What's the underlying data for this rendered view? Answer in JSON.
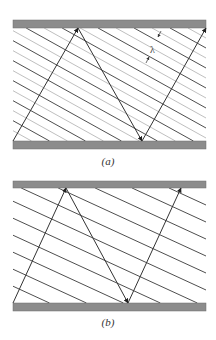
{
  "panels": [
    {
      "id": "a",
      "caption": "(a)",
      "label": "λ",
      "plate_color": "#8c8c8c",
      "ray_color": "#333333",
      "wavefront_color": "#3a3a3a",
      "secondary_wavefront_color": "#b8b8b8",
      "top_plate": {
        "x": 13,
        "y": 20,
        "w": 193,
        "h": 8
      },
      "bottom_plate": {
        "x": 13,
        "y": 141,
        "w": 193,
        "h": 8
      },
      "rays": [
        [
          13,
          141,
          78,
          28
        ],
        [
          78,
          28,
          142,
          141
        ],
        [
          142,
          141,
          206,
          28
        ]
      ],
      "wavefront_slope": 0.556,
      "wavefront_spacing_y": 20,
      "has_secondary": true
    },
    {
      "id": "b",
      "caption": "(b)",
      "plate_color": "#8c8c8c",
      "ray_color": "#333333",
      "wavefront_color": "#3a3a3a",
      "top_plate": {
        "x": 13,
        "y": 181,
        "w": 193,
        "h": 7
      },
      "bottom_plate": {
        "x": 13,
        "y": 303,
        "w": 193,
        "h": 8
      },
      "rays": [
        [
          13,
          303,
          66,
          188
        ],
        [
          66,
          188,
          128,
          303
        ],
        [
          128,
          303,
          181,
          188
        ]
      ],
      "wavefront_slope": 0.46,
      "wavefront_spacing_y": 17,
      "has_secondary": false
    }
  ]
}
